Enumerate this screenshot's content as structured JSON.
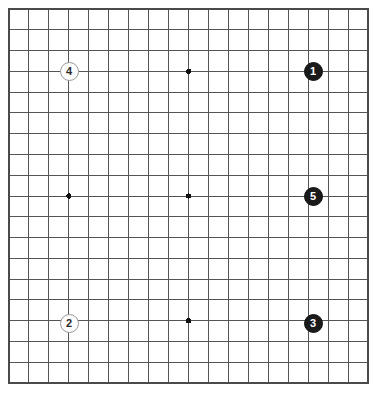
{
  "board": {
    "type": "go-board",
    "size": 19,
    "grid_columns": 19,
    "grid_rows": 19,
    "origin_x": 9,
    "origin_y": 9,
    "step_x": 19.95,
    "step_y": 20.78,
    "line_color": "#555555",
    "border_color": "#4a4a4a",
    "background_color": "#ffffff",
    "line_width": 1,
    "border_width": 1.6,
    "star_point_color": "#111111",
    "star_point_radius": 2.6,
    "star_points": [
      {
        "col": 3,
        "row": 3
      },
      {
        "col": 9,
        "row": 3
      },
      {
        "col": 15,
        "row": 3
      },
      {
        "col": 3,
        "row": 9
      },
      {
        "col": 9,
        "row": 9
      },
      {
        "col": 15,
        "row": 9
      },
      {
        "col": 3,
        "row": 15
      },
      {
        "col": 9,
        "row": 15
      },
      {
        "col": 15,
        "row": 15
      }
    ],
    "stone_radius": 9.5,
    "stones": [
      {
        "label": "1",
        "color": "black",
        "col": 15,
        "row": 3,
        "cx": 313,
        "cy": 71
      },
      {
        "label": "2",
        "color": "white",
        "col": 3,
        "row": 15,
        "cx": 69,
        "cy": 323
      },
      {
        "label": "3",
        "color": "black",
        "col": 15,
        "row": 15,
        "cx": 313,
        "cy": 323
      },
      {
        "label": "4",
        "color": "white",
        "col": 3,
        "row": 3,
        "cx": 69,
        "cy": 71
      },
      {
        "label": "5",
        "color": "black",
        "col": 15,
        "row": 9,
        "cx": 313,
        "cy": 196
      }
    ]
  }
}
